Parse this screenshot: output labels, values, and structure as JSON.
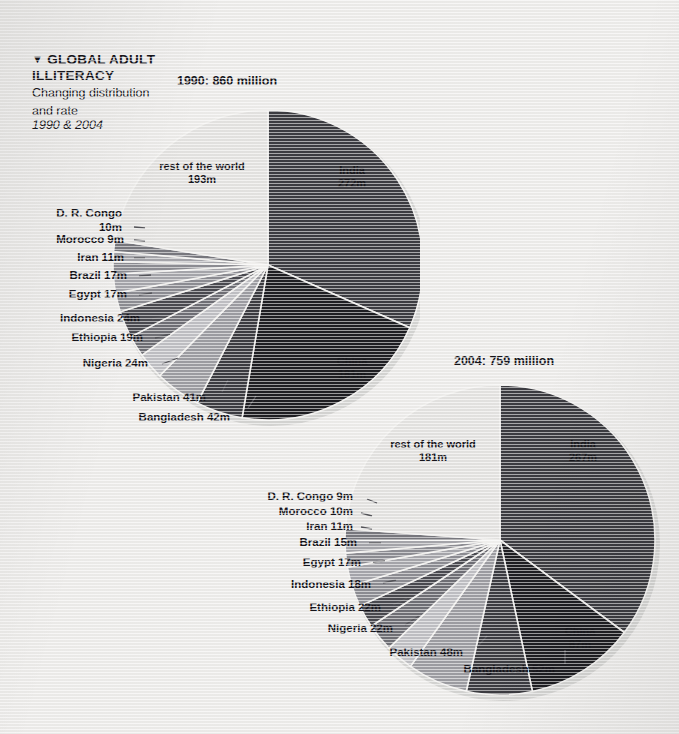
{
  "page": {
    "background_color": "#edecea",
    "text_color": "#15141a"
  },
  "header": {
    "marker": "▼",
    "title_line1": "GLOBAL ADULT",
    "title_line2": "ILLITERACY",
    "subtitle_line1": "Changing distribution",
    "subtitle_line2": "and rate",
    "years": "1990 & 2004"
  },
  "chart_data": [
    {
      "type": "pie",
      "id": "pie-1990",
      "title": "1990: 860 million",
      "total": 860,
      "unit": "m",
      "start_angle_deg": 0,
      "direction": "clockwise",
      "categories": [
        "India",
        "China",
        "Bangladesh",
        "Pakistan",
        "Nigeria",
        "Ethiopia",
        "Indonesia",
        "Egypt",
        "Brazil",
        "Iran",
        "Morocco",
        "D. R. Congo",
        "rest of the world"
      ],
      "values": [
        272,
        181,
        42,
        41,
        24,
        19,
        24,
        17,
        17,
        11,
        9,
        10,
        193
      ],
      "labels": [
        {
          "name": "India",
          "value": "272m",
          "text": "India\n272m",
          "color": "#3c3c41",
          "placement": "inside"
        },
        {
          "name": "China",
          "value": "181m",
          "text": "China\n181m",
          "color": "#1e1e22",
          "placement": "inside"
        },
        {
          "name": "Bangladesh",
          "value": "42m",
          "text": "Bangladesh 42m",
          "color": "#3c3c41",
          "placement": "outside"
        },
        {
          "name": "Pakistan",
          "value": "41m",
          "text": "Pakistan 41m",
          "color": "#9d9da2",
          "placement": "outside"
        },
        {
          "name": "Nigeria",
          "value": "24m",
          "text": "Nigeria 24m",
          "color": "#bfbfc3",
          "placement": "outside"
        },
        {
          "name": "Ethiopia",
          "value": "19m",
          "text": "Ethiopia 19m",
          "color": "#6f6f75",
          "placement": "outside"
        },
        {
          "name": "Indonesia",
          "value": "24m",
          "text": "Indonesia 24m",
          "color": "#4a4a50",
          "placement": "outside"
        },
        {
          "name": "Egypt",
          "value": "17m",
          "text": "Egypt 17m",
          "color": "#8d8d93",
          "placement": "outside"
        },
        {
          "name": "Brazil",
          "value": "17m",
          "text": "Brazil 17m",
          "color": "#a6a6ab",
          "placement": "outside"
        },
        {
          "name": "Iran",
          "value": "11m",
          "text": "Iran 11m",
          "color": "#8d8d93",
          "placement": "outside"
        },
        {
          "name": "Morocco",
          "value": "9m",
          "text": "Morocco 9m",
          "color": "#a6a6ab",
          "placement": "outside"
        },
        {
          "name": "D. R. Congo",
          "value": "10m",
          "text": "D. R. Congo\n10m",
          "color": "#78787e",
          "placement": "outside"
        },
        {
          "name": "rest of the world",
          "value": "193m",
          "text": "rest of the world\n193m",
          "color": "#e4e3e1",
          "placement": "inside"
        }
      ]
    },
    {
      "type": "pie",
      "id": "pie-2004",
      "title": "2004: 759 million",
      "total": 759,
      "unit": "m",
      "start_angle_deg": 0,
      "direction": "clockwise",
      "categories": [
        "India",
        "China",
        "Bangladesh",
        "Pakistan",
        "Nigeria",
        "Ethiopia",
        "Indonesia",
        "Egypt",
        "Brazil",
        "Iran",
        "Morocco",
        "D. R. Congo",
        "rest of the world"
      ],
      "values": [
        267,
        87,
        52,
        48,
        22,
        22,
        18,
        17,
        15,
        11,
        10,
        9,
        181
      ],
      "labels": [
        {
          "name": "India",
          "value": "267m",
          "text": "India\n267m",
          "color": "#3c3c41",
          "placement": "inside"
        },
        {
          "name": "China",
          "value": "87m",
          "text": "China\n87m",
          "color": "#1e1e22",
          "placement": "inside"
        },
        {
          "name": "Bangladesh",
          "value": "52m",
          "text": "Bangladesh 52m",
          "color": "#3c3c41",
          "placement": "outside"
        },
        {
          "name": "Pakistan",
          "value": "48m",
          "text": "Pakistan 48m",
          "color": "#9d9da2",
          "placement": "outside"
        },
        {
          "name": "Nigeria",
          "value": "22m",
          "text": "Nigeria 22m",
          "color": "#bfbfc3",
          "placement": "outside"
        },
        {
          "name": "Ethiopia",
          "value": "22m",
          "text": "Ethiopia 22m",
          "color": "#6f6f75",
          "placement": "outside"
        },
        {
          "name": "Indonesia",
          "value": "18m",
          "text": "Indonesia 18m",
          "color": "#4a4a50",
          "placement": "outside"
        },
        {
          "name": "Egypt",
          "value": "17m",
          "text": "Egypt 17m",
          "color": "#8d8d93",
          "placement": "outside"
        },
        {
          "name": "Brazil",
          "value": "15m",
          "text": "Brazil 15m",
          "color": "#a6a6ab",
          "placement": "outside"
        },
        {
          "name": "Iran",
          "value": "11m",
          "text": "Iran 11m",
          "color": "#8d8d93",
          "placement": "outside"
        },
        {
          "name": "Morocco",
          "value": "10m",
          "text": "Morocco 10m",
          "color": "#a6a6ab",
          "placement": "outside"
        },
        {
          "name": "D. R. Congo",
          "value": "9m",
          "text": "D. R. Congo 9m",
          "color": "#78787e",
          "placement": "outside"
        },
        {
          "name": "rest of the world",
          "value": "181m",
          "text": "rest of the world\n181m",
          "color": "#e4e3e1",
          "placement": "inside"
        }
      ]
    }
  ]
}
